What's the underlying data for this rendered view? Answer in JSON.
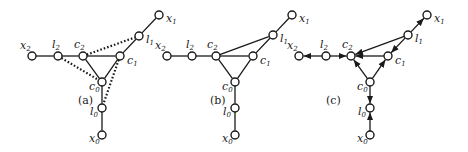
{
  "panels": [
    {
      "caption": "(a)",
      "caption_pos": [
        78,
        104
      ],
      "nodes": {
        "x2": {
          "label": "x",
          "sub": "2",
          "pos": [
            32,
            56
          ],
          "lpos": [
            20,
            49
          ]
        },
        "l2": {
          "label": "l",
          "sub": "2",
          "pos": [
            58,
            56
          ],
          "lpos": [
            52,
            48
          ]
        },
        "c2": {
          "label": "c",
          "sub": "2",
          "pos": [
            83,
            56
          ],
          "lpos": [
            74,
            48
          ]
        },
        "c1": {
          "label": "c",
          "sub": "1",
          "pos": [
            120,
            56
          ],
          "lpos": [
            127,
            64
          ]
        },
        "c0": {
          "label": "c",
          "sub": "0",
          "pos": [
            102,
            82
          ],
          "lpos": [
            89,
            90
          ]
        },
        "l0": {
          "label": "l",
          "sub": "0",
          "pos": [
            102,
            108
          ],
          "lpos": [
            90,
            115
          ]
        },
        "l1": {
          "label": "l",
          "sub": "1",
          "pos": [
            139,
            36
          ],
          "lpos": [
            146,
            43
          ]
        },
        "x1": {
          "label": "x",
          "sub": "1",
          "pos": [
            159,
            15
          ],
          "lpos": [
            166,
            22
          ]
        },
        "x0": {
          "label": "x",
          "sub": "0",
          "pos": [
            102,
            135
          ],
          "lpos": [
            89,
            142
          ]
        }
      },
      "solid_edges": [
        [
          "x2",
          "l2"
        ],
        [
          "l2",
          "c2"
        ],
        [
          "c2",
          "c1"
        ],
        [
          "c2",
          "c0"
        ],
        [
          "c1",
          "c0"
        ],
        [
          "c0",
          "l0"
        ],
        [
          "l0",
          "x0"
        ],
        [
          "c1",
          "l1"
        ],
        [
          "l1",
          "x1"
        ]
      ],
      "dotted_edges": [
        [
          "c2",
          "l1"
        ],
        [
          "l2",
          "c0"
        ],
        [
          "c1",
          "l0"
        ]
      ],
      "arrows": []
    },
    {
      "caption": "(b)",
      "caption_pos": [
        210,
        104
      ],
      "nodes": {
        "x2": {
          "label": "x",
          "sub": "2",
          "pos": [
            167,
            56
          ],
          "lpos": [
            155,
            49
          ]
        },
        "l2": {
          "label": "l",
          "sub": "2",
          "pos": [
            192,
            56
          ],
          "lpos": [
            186,
            48
          ]
        },
        "c2": {
          "label": "c",
          "sub": "2",
          "pos": [
            216,
            56
          ],
          "lpos": [
            207,
            48
          ]
        },
        "c1": {
          "label": "c",
          "sub": "1",
          "pos": [
            253,
            56
          ],
          "lpos": [
            260,
            64
          ]
        },
        "c0": {
          "label": "c",
          "sub": "0",
          "pos": [
            235,
            82
          ],
          "lpos": [
            222,
            90
          ]
        },
        "l0": {
          "label": "l",
          "sub": "0",
          "pos": [
            235,
            108
          ],
          "lpos": [
            223,
            115
          ]
        },
        "l1": {
          "label": "l",
          "sub": "1",
          "pos": [
            273,
            35
          ],
          "lpos": [
            280,
            42
          ]
        },
        "x1": {
          "label": "x",
          "sub": "1",
          "pos": [
            292,
            15
          ],
          "lpos": [
            299,
            22
          ]
        },
        "x0": {
          "label": "x",
          "sub": "0",
          "pos": [
            235,
            135
          ],
          "lpos": [
            222,
            142
          ]
        }
      },
      "solid_edges": [
        [
          "x2",
          "l2"
        ],
        [
          "l2",
          "c2"
        ],
        [
          "c2",
          "c1"
        ],
        [
          "c2",
          "c0"
        ],
        [
          "c1",
          "c0"
        ],
        [
          "c0",
          "l0"
        ],
        [
          "l0",
          "x0"
        ],
        [
          "c1",
          "l1"
        ],
        [
          "l1",
          "x1"
        ],
        [
          "c2",
          "l1"
        ]
      ],
      "dotted_edges": [],
      "arrows": []
    },
    {
      "caption": "(c)",
      "caption_pos": [
        326,
        104
      ],
      "nodes": {
        "x2": {
          "label": "x",
          "sub": "2",
          "pos": [
            299,
            56
          ],
          "lpos": [
            287,
            49
          ]
        },
        "l2": {
          "label": "l",
          "sub": "2",
          "pos": [
            326,
            56
          ],
          "lpos": [
            320,
            48
          ]
        },
        "c2": {
          "label": "c",
          "sub": "2",
          "pos": [
            351,
            56
          ],
          "lpos": [
            342,
            48
          ]
        },
        "c1": {
          "label": "c",
          "sub": "1",
          "pos": [
            388,
            56
          ],
          "lpos": [
            395,
            64
          ]
        },
        "c0": {
          "label": "c",
          "sub": "0",
          "pos": [
            370,
            82
          ],
          "lpos": [
            357,
            90
          ]
        },
        "l0": {
          "label": "l",
          "sub": "0",
          "pos": [
            370,
            108
          ],
          "lpos": [
            358,
            115
          ]
        },
        "l1": {
          "label": "l",
          "sub": "1",
          "pos": [
            408,
            35
          ],
          "lpos": [
            415,
            42
          ]
        },
        "x1": {
          "label": "x",
          "sub": "1",
          "pos": [
            427,
            15
          ],
          "lpos": [
            434,
            22
          ]
        },
        "x0": {
          "label": "x",
          "sub": "0",
          "pos": [
            370,
            135
          ],
          "lpos": [
            357,
            142
          ]
        }
      },
      "solid_edges": [],
      "dotted_edges": [],
      "arrows": [
        [
          "l2",
          "x2"
        ],
        [
          "l2",
          "c2"
        ],
        [
          "c1",
          "c2"
        ],
        [
          "c0",
          "c2"
        ],
        [
          "c0",
          "c1"
        ],
        [
          "l1",
          "c2"
        ],
        [
          "l1",
          "c1"
        ],
        [
          "l1",
          "x1"
        ],
        [
          "c0",
          "l0"
        ],
        [
          "x0",
          "l0"
        ]
      ]
    }
  ],
  "style": {
    "ink": "#1a1a1a",
    "background": "#ffffff",
    "node_radius": 4
  }
}
